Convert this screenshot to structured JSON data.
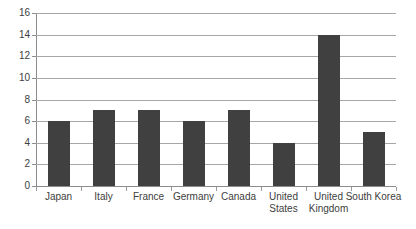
{
  "chart_data": {
    "type": "bar",
    "title": "",
    "subtitle": "",
    "xlabel": "",
    "ylabel": "",
    "categories": [
      "Japan",
      "Italy",
      "France",
      "Germany",
      "Canada",
      "United States",
      "United Kingdom",
      "South Korea"
    ],
    "category_label_lines": [
      [
        "Japan"
      ],
      [
        "Italy"
      ],
      [
        "France"
      ],
      [
        "Germany"
      ],
      [
        "Canada"
      ],
      [
        "United",
        "States"
      ],
      [
        "United",
        "Kingdom"
      ],
      [
        "South Korea"
      ]
    ],
    "values": [
      6,
      7,
      7,
      6,
      7,
      4,
      14,
      5
    ],
    "ylim": [
      0,
      16
    ],
    "ytick_step": 2,
    "yticks": [
      0,
      2,
      4,
      6,
      8,
      10,
      12,
      14,
      16
    ],
    "ytick_labels": [
      "0",
      "2",
      "4",
      "6",
      "8",
      "10",
      "12",
      "14",
      "16"
    ],
    "grid": "horizontal",
    "legend": "none",
    "bar_color": "#404040",
    "gridline_color": "#a6a6a6",
    "axis_color": "#8c8c8c",
    "background_color": "#ffffff",
    "text_color": "#404040"
  }
}
